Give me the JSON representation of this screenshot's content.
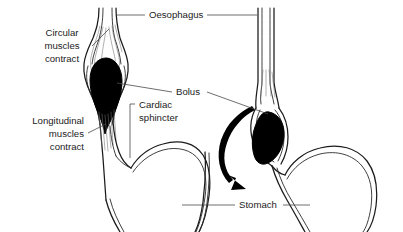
{
  "diagram": {
    "background_color": "#ffffff",
    "ink_color": "#1b1b1b",
    "leader_color": "#4a4a4a",
    "bolus_color": "#000000",
    "panels": [
      {
        "id": "left-panel",
        "name": "bolus-in-upper-oesophagus",
        "description": "Circular muscles contract behind the bolus in the upper oesophagus"
      },
      {
        "id": "right-panel",
        "name": "bolus-entering-stomach",
        "description": "Bolus is pushed down towards the cardiac sphincter and into the stomach"
      }
    ],
    "labels": [
      {
        "id": "oesophagus",
        "text": "Oesophagus",
        "align": "middle",
        "leaders": [
          "left",
          "right"
        ]
      },
      {
        "id": "circular-muscles",
        "text": "Circular\nmuscles\ncontract",
        "lines": [
          "Circular",
          "muscles",
          "contract"
        ],
        "align": "middle",
        "leaders": [
          "right"
        ]
      },
      {
        "id": "longitudinal-muscles",
        "text": "Longitudinal\nmuscles\ncontract",
        "lines": [
          "Longitudinal",
          "muscles",
          "contract"
        ],
        "align": "right",
        "leaders": [
          "right"
        ]
      },
      {
        "id": "bolus",
        "text": "Bolus",
        "align": "middle",
        "leaders": [
          "left",
          "right"
        ]
      },
      {
        "id": "cardiac-sphincter",
        "text": "Cardiac\nsphincter",
        "lines": [
          "Cardiac",
          "sphincter"
        ],
        "align": "left",
        "leaders": [
          "bracket-left"
        ]
      },
      {
        "id": "stomach",
        "text": "Stomach",
        "align": "middle",
        "leaders": [
          "left",
          "right"
        ]
      }
    ],
    "arrow": {
      "id": "swallow-direction-arrow",
      "description": "Thick curved arrow showing the downward direction of bolus travel into the stomach"
    }
  }
}
